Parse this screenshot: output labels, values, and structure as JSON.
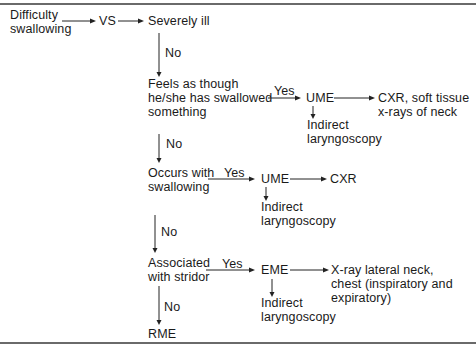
{
  "flowchart": {
    "start": {
      "line1": "Difficulty",
      "line2": "swallowing"
    },
    "vs": "VS",
    "severely_ill": "Severely ill",
    "no_label": "No",
    "yes_label": "Yes",
    "node_swallowed": {
      "line1": "Feels as though",
      "line2": "he/she has swallowed",
      "line3": "something"
    },
    "node_swallowed_exam": "UME",
    "node_swallowed_result": {
      "line1": "CXR, soft tissue",
      "line2": "x-rays of neck"
    },
    "node_swallowed_sub": {
      "line1": "Indirect",
      "line2": "laryngoscopy"
    },
    "node_occurs": {
      "line1": "Occurs with",
      "line2": "swallowing"
    },
    "node_occurs_exam": "UME",
    "node_occurs_result": "CXR",
    "node_occurs_sub": {
      "line1": "Indirect",
      "line2": "laryngoscopy"
    },
    "node_stridor": {
      "line1": "Associated",
      "line2": "with stridor"
    },
    "node_stridor_exam": "EME",
    "node_stridor_result": {
      "line1": "X-ray lateral neck,",
      "line2": "chest (inspiratory and",
      "line3": "expiratory)"
    },
    "node_stridor_sub": {
      "line1": "Indirect",
      "line2": "laryngoscopy"
    },
    "end": "RME"
  }
}
